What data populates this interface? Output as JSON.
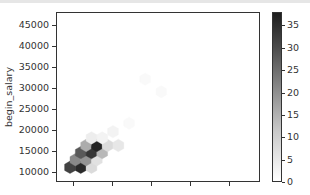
{
  "chart_data": {
    "type": "heatmap",
    "subtype": "hexbin",
    "title": "",
    "xlabel": "",
    "ylabel": "begin_salary",
    "x_tick_labels": [
      "",
      "",
      "",
      "",
      ""
    ],
    "y_ticks": [
      10000,
      15000,
      20000,
      25000,
      30000,
      35000,
      40000,
      45000
    ],
    "ylim": [
      7500,
      48000
    ],
    "grid": false,
    "colormap": "Greys",
    "colorbar": {
      "ticks": [
        0,
        5,
        10,
        15,
        20,
        25,
        30,
        35
      ],
      "range": [
        0,
        38
      ]
    },
    "bins": [
      {
        "col": 0,
        "y": 11000,
        "count": 32
      },
      {
        "col": 1,
        "y": 11000,
        "count": 36
      },
      {
        "col": 2,
        "y": 11000,
        "count": 6
      },
      {
        "col": 0.5,
        "y": 12800,
        "count": 20
      },
      {
        "col": 1.5,
        "y": 12800,
        "count": 18
      },
      {
        "col": 2.5,
        "y": 12800,
        "count": 5
      },
      {
        "col": 1,
        "y": 14500,
        "count": 28
      },
      {
        "col": 2,
        "y": 14500,
        "count": 34
      },
      {
        "col": 3,
        "y": 14500,
        "count": 12
      },
      {
        "col": 1.5,
        "y": 16200,
        "count": 14
      },
      {
        "col": 2.5,
        "y": 16200,
        "count": 37
      },
      {
        "col": 3.5,
        "y": 16200,
        "count": 6
      },
      {
        "col": 4.5,
        "y": 16200,
        "count": 4
      },
      {
        "col": 2,
        "y": 18000,
        "count": 3
      },
      {
        "col": 3,
        "y": 18000,
        "count": 2
      },
      {
        "col": 4,
        "y": 19500,
        "count": 2
      },
      {
        "col": 5.5,
        "y": 21500,
        "count": 1
      },
      {
        "col": 8.5,
        "y": 29000,
        "count": 1
      },
      {
        "col": 7,
        "y": 32000,
        "count": 1
      }
    ]
  },
  "colors": {
    "axis": "#333333",
    "background": "#ffffff"
  }
}
